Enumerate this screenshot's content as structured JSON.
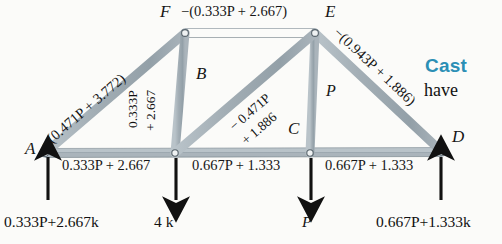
{
  "figure": {
    "type": "truss-free-body-diagram",
    "background_color": "#fbfbf9",
    "member_color": "#9aa7ae",
    "member_edge_color": "#6d7a82",
    "joint_color": "#e9edef",
    "arrow_color": "#111111",
    "accent_color": "#2b8fb5"
  },
  "nodes": [
    {
      "id": "A",
      "label": "A",
      "x": 45,
      "y": 153
    },
    {
      "id": "F",
      "label": "F",
      "x": 185,
      "y": 33
    },
    {
      "id": "E",
      "label": "E",
      "x": 315,
      "y": 33
    },
    {
      "id": "B",
      "label": "B",
      "x": 175,
      "y": 153
    },
    {
      "id": "C",
      "label": "C",
      "x": 310,
      "y": 153
    },
    {
      "id": "D",
      "label": "D",
      "x": 442,
      "y": 152
    }
  ],
  "members": [
    {
      "id": "AF",
      "from": "A",
      "to": "F",
      "force": "−(0.471P + 3.772)"
    },
    {
      "id": "FE",
      "from": "F",
      "to": "E",
      "force": "−(0.333P + 2.667)"
    },
    {
      "id": "ED",
      "from": "E",
      "to": "D",
      "force": "−(0.943P + 1.886)"
    },
    {
      "id": "FB",
      "from": "F",
      "to": "B",
      "force_line1": "0.333P",
      "force_line2": "+ 2.667"
    },
    {
      "id": "BE",
      "from": "B",
      "to": "E",
      "force_line1": "− 0.471P",
      "force_line2": "+ 1.886"
    },
    {
      "id": "EC",
      "from": "E",
      "to": "C",
      "force": "P"
    },
    {
      "id": "AB",
      "from": "A",
      "to": "B",
      "force": "0.333P + 2.667"
    },
    {
      "id": "BC",
      "from": "B",
      "to": "C",
      "force": "0.667P + 1.333"
    },
    {
      "id": "CD",
      "from": "C",
      "to": "D",
      "force": "0.667P + 1.333"
    }
  ],
  "forces": [
    {
      "id": "reaction-a",
      "at": "A",
      "direction": "up",
      "label": "0.333P+2.667k",
      "label_x": 4,
      "label_y": 213
    },
    {
      "id": "load-b",
      "at": "B",
      "direction": "down",
      "label": "4 k",
      "label_x": 154,
      "label_y": 213
    },
    {
      "id": "load-c",
      "at": "C",
      "direction": "down",
      "label": "P",
      "label_x": 302,
      "label_y": 213
    },
    {
      "id": "reaction-d",
      "at": "D",
      "direction": "up",
      "label": "0.667P+1.333k",
      "label_x": 376,
      "label_y": 213
    }
  ],
  "side_text": {
    "heading": "Cast",
    "body": "have"
  }
}
